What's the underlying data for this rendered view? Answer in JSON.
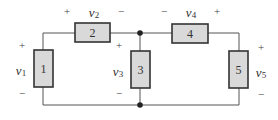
{
  "diagram": {
    "type": "circuit",
    "elements": [
      {
        "id": "1",
        "label": "1",
        "voltage": "v",
        "sub": "1",
        "plus": "+",
        "minus": "−"
      },
      {
        "id": "2",
        "label": "2",
        "voltage": "v",
        "sub": "2",
        "plus": "+",
        "minus": "−"
      },
      {
        "id": "3",
        "label": "3",
        "voltage": "v",
        "sub": "3",
        "plus": "+",
        "minus": "−"
      },
      {
        "id": "4",
        "label": "4",
        "voltage": "v",
        "sub": "4",
        "plus": "+",
        "minus": "−"
      },
      {
        "id": "5",
        "label": "5",
        "voltage": "v",
        "sub": "5",
        "plus": "+",
        "minus": "−"
      }
    ],
    "nodes": [
      "top-center",
      "bottom-center"
    ],
    "colors": {
      "element_fill": "#d9d9d9",
      "wire": "#555555"
    }
  }
}
